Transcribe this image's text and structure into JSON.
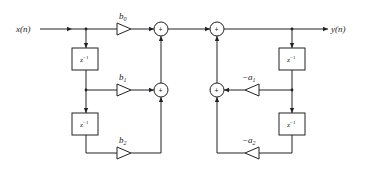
{
  "diagram": {
    "input_label": "x(n)",
    "output_label": "y(n)",
    "feedforward": {
      "gains": [
        {
          "label_base": "b",
          "label_sub": "0"
        },
        {
          "label_base": "b",
          "label_sub": "1"
        },
        {
          "label_base": "b",
          "label_sub": "2"
        }
      ],
      "delays": [
        {
          "base": "z",
          "exp": "−1"
        },
        {
          "base": "z",
          "exp": "−1"
        }
      ]
    },
    "feedback": {
      "gains": [
        {
          "label_base": "−a",
          "label_sub": "1"
        },
        {
          "label_base": "−a",
          "label_sub": "2"
        }
      ],
      "delays": [
        {
          "base": "z",
          "exp": "−1"
        },
        {
          "base": "z",
          "exp": "−1"
        }
      ]
    },
    "adders": [
      {
        "symbol": "+"
      },
      {
        "symbol": "+"
      },
      {
        "symbol": "+"
      },
      {
        "symbol": "+"
      }
    ]
  }
}
